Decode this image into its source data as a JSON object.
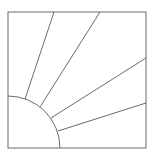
{
  "diagram": {
    "type": "geometric-line-drawing",
    "stroke_color": "#6b6b6b",
    "background": "#ffffff",
    "square": {
      "x": 8,
      "y": 12,
      "width": 138,
      "height": 136
    },
    "arc": {
      "cx": 8,
      "cy": 148,
      "r": 52
    },
    "rays": [
      {
        "x1": 25,
        "y1": 99,
        "x2": 54,
        "y2": 12
      },
      {
        "x1": 40,
        "y1": 107,
        "x2": 100,
        "y2": 12
      },
      {
        "x1": 51,
        "y1": 118,
        "x2": 146,
        "y2": 58
      },
      {
        "x1": 58,
        "y1": 131,
        "x2": 146,
        "y2": 103
      }
    ]
  }
}
